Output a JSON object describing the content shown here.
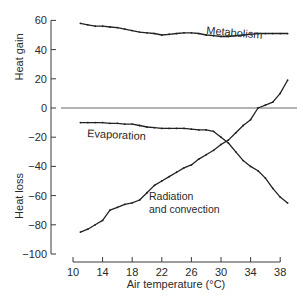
{
  "chart_data": {
    "type": "line",
    "title": "",
    "xlabel": "Air temperature (°C)",
    "ylabel_top": "Heat gain",
    "ylabel_bottom": "Heat loss",
    "xlim": [
      10,
      38
    ],
    "ylim": [
      -100,
      60
    ],
    "xticks": [
      10,
      14,
      18,
      22,
      26,
      30,
      34,
      38
    ],
    "yticks": [
      60,
      40,
      20,
      0,
      -20,
      -40,
      -60,
      -80,
      -100
    ],
    "grid": false,
    "legend": "inline labels",
    "series": [
      {
        "name": "Metabolism",
        "x": [
          11,
          12,
          13,
          14,
          15,
          16,
          17,
          18,
          19,
          20,
          21,
          22,
          23,
          24,
          25,
          26,
          27,
          28,
          29,
          30,
          31,
          32,
          33,
          34,
          35,
          36,
          37,
          38,
          39
        ],
        "values": [
          58,
          57,
          56,
          56,
          55.5,
          55,
          54,
          53,
          52,
          51.5,
          51,
          50,
          50.5,
          51,
          51.5,
          51.5,
          51,
          50,
          49.5,
          49,
          49,
          49.5,
          50,
          50.5,
          51,
          51,
          51,
          51,
          51
        ]
      },
      {
        "name": "Evaporation",
        "x": [
          11,
          12,
          13,
          14,
          15,
          16,
          17,
          18,
          19,
          20,
          21,
          22,
          23,
          24,
          25,
          26,
          27,
          28,
          29,
          30,
          31,
          32,
          33,
          34,
          35,
          36,
          37,
          38,
          39
        ],
        "values": [
          -10,
          -10,
          -10,
          -10,
          -10.5,
          -10.5,
          -11,
          -11,
          -12,
          -13,
          -13.5,
          -14,
          -14,
          -14,
          -14,
          -14.5,
          -15,
          -15,
          -16,
          -20,
          -24,
          -30,
          -36,
          -40,
          -43,
          -48,
          -55,
          -61,
          -65
        ]
      },
      {
        "name": "Radiation and convection",
        "x": [
          11,
          12,
          13,
          14,
          15,
          16,
          17,
          18,
          19,
          20,
          21,
          22,
          23,
          24,
          25,
          26,
          27,
          28,
          29,
          30,
          31,
          32,
          33,
          34,
          35,
          36,
          37,
          38,
          39
        ],
        "values": [
          -85,
          -83,
          -80,
          -77,
          -70,
          -68,
          -66,
          -65,
          -63,
          -58,
          -53,
          -50,
          -47,
          -44,
          -41,
          -39,
          -35,
          -32,
          -29,
          -25,
          -22,
          -17,
          -12,
          -8,
          0,
          2,
          4,
          10,
          19
        ]
      }
    ]
  },
  "labels": {
    "metabolism": "Metabolism",
    "evaporation": "Evaporation",
    "radiation_1": "Radiation",
    "radiation_2": "and convection",
    "xlabel": "Air temperature (°C)",
    "heat_gain": "Heat gain",
    "heat_loss": "Heat loss"
  }
}
